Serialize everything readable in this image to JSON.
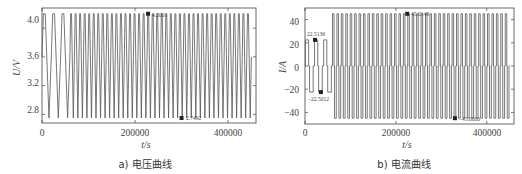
{
  "chart_data": [
    {
      "type": "line",
      "panel": "a",
      "caption": "a) 电压曲线",
      "title": "",
      "xlabel": "t/s",
      "ylabel": "U/V",
      "xlim": [
        0,
        460000
      ],
      "ylim": [
        2.68,
        4.28
      ],
      "xticks": [
        0,
        200000,
        400000
      ],
      "xtick_labels": [
        "0",
        "200000",
        "400000"
      ],
      "yticks": [
        2.8,
        3.2,
        3.6,
        4.0
      ],
      "ytick_labels": [
        "2.8",
        "3.2",
        "3.6",
        "4.0"
      ],
      "grid": false,
      "legend": null,
      "description": "Voltage oscillates between ~2.75 V and ~4.2 V; first three slow cycles (0-60000 s) then ~40 fast cycles until ~450000 s",
      "series": [
        {
          "name": "voltage",
          "slow_cycles": {
            "count": 3,
            "t_start": 0,
            "t_end": 60000,
            "min": 2.75,
            "max": 4.2
          },
          "fast_cycles": {
            "count": 40,
            "t_start": 60000,
            "t_end": 450000,
            "min": 2.75,
            "max": 4.2
          }
        }
      ],
      "annotations": [
        {
          "label": "4.2001",
          "x": 228000,
          "y": 4.2001,
          "marker": "square"
        },
        {
          "label": "2.7492",
          "x": 300000,
          "y": 2.7492,
          "marker": "square"
        }
      ]
    },
    {
      "type": "line",
      "panel": "b",
      "caption": "b) 电流曲线",
      "title": "",
      "xlabel": "t/s",
      "ylabel": "I/A",
      "xlim": [
        0,
        460000
      ],
      "ylim": [
        -50,
        50
      ],
      "xticks": [
        0,
        200000,
        400000
      ],
      "xtick_labels": [
        "0",
        "200000",
        "400000"
      ],
      "yticks": [
        -40,
        -20,
        0,
        20,
        40
      ],
      "ytick_labels": [
        "−40",
        "−20",
        "0",
        "20",
        "40"
      ],
      "grid": false,
      "legend": null,
      "description": "Square-wave current: first cycles at ±22.5 A (0-60000 s), then ±45 A fast pulses until ~450000 s",
      "series": [
        {
          "name": "current",
          "low_current_cycles": {
            "count": 3,
            "t_start": 0,
            "t_end": 60000,
            "high": 22.5136,
            "low": -22.5012
          },
          "high_current_cycles": {
            "count": 40,
            "t_start": 60000,
            "t_end": 450000,
            "high": 45.0148,
            "low": -45.0
          }
        }
      ],
      "annotations": [
        {
          "label": "22.5136",
          "x": 22000,
          "y": 22.5136,
          "marker": "square"
        },
        {
          "label": "−22.5012",
          "x": 35000,
          "y": -22.5012,
          "marker": "square"
        },
        {
          "label": "45.0148",
          "x": 225000,
          "y": 45.0148,
          "marker": "square"
        },
        {
          "label": "−45.0000",
          "x": 330000,
          "y": -45.0,
          "marker": "square"
        }
      ]
    }
  ],
  "panel_a": {
    "caption": "a) 电压曲线",
    "xlabel": "t/s",
    "ylabel": "U/V",
    "xtick_labels": [
      "0",
      "200000",
      "400000"
    ],
    "ytick_labels": [
      "2.8",
      "3.2",
      "3.6",
      "4.0"
    ],
    "ann_max": "4.2001",
    "ann_min": "2.7492"
  },
  "panel_b": {
    "caption": "b) 电流曲线",
    "xlabel": "t/s",
    "ylabel": "I/A",
    "xtick_labels": [
      "0",
      "200000",
      "400000"
    ],
    "ytick_labels": [
      "40",
      "20",
      "0",
      "−20",
      "−40"
    ],
    "ann_pos_low": "22.5136",
    "ann_neg_low": "−22.5012",
    "ann_pos_high": "45.0148",
    "ann_neg_high": "−45.0000"
  },
  "colors": {
    "line": "#555555",
    "axis": "#444444",
    "marker": "#222222"
  }
}
